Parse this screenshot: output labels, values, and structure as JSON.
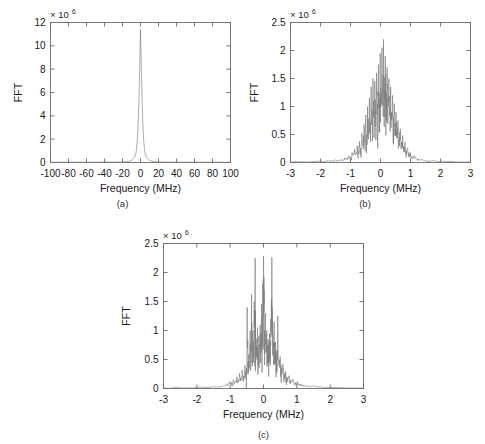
{
  "figure": {
    "background": "#ffffff",
    "trace_color": "#7d7d7d",
    "axis_color": "#6a6a6a"
  },
  "panels": [
    {
      "id": "a",
      "caption": "(a)",
      "xlabel": "Frequency (MHz)",
      "ylabel": "FFT",
      "exponent_mantissa": "× 10",
      "exponent_power": "6",
      "xticks": [
        "-100",
        "-80",
        "-60",
        "-40",
        "-20",
        "0",
        "20",
        "40",
        "60",
        "80",
        "100"
      ],
      "xtick_values": [
        -100,
        -80,
        -60,
        -40,
        -20,
        0,
        20,
        40,
        60,
        80,
        100
      ],
      "yticks": [
        "0",
        "2",
        "4",
        "6",
        "8",
        "10",
        "12"
      ],
      "ytick_values": [
        0,
        2,
        4,
        6,
        8,
        10,
        12
      ]
    },
    {
      "id": "b",
      "caption": "(b)",
      "xlabel": "Frequency (MHz)",
      "ylabel": "FFT",
      "exponent_mantissa": "× 10",
      "exponent_power": "6",
      "xticks": [
        "-3",
        "-2",
        "-1",
        "0",
        "1",
        "2",
        "3"
      ],
      "xtick_values": [
        -3,
        -2,
        -1,
        0,
        1,
        2,
        3
      ],
      "yticks": [
        "0",
        "0.5",
        "1",
        "1.5",
        "2",
        "2.5"
      ],
      "ytick_values": [
        0,
        0.5,
        1,
        1.5,
        2,
        2.5
      ]
    },
    {
      "id": "c",
      "caption": "(c)",
      "xlabel": "Frequency (MHz)",
      "ylabel": "FFT",
      "exponent_mantissa": "× 10",
      "exponent_power": "6",
      "xticks": [
        "-3",
        "-2",
        "-1",
        "0",
        "1",
        "2",
        "3"
      ],
      "xtick_values": [
        -3,
        -2,
        -1,
        0,
        1,
        2,
        3
      ],
      "yticks": [
        "0",
        "0.5",
        "1",
        "1.5",
        "2",
        "2.5"
      ],
      "ytick_values": [
        0,
        0.5,
        1,
        1.5,
        2,
        2.5
      ]
    }
  ],
  "chart_data": [
    {
      "type": "line",
      "panel": "a",
      "title": "",
      "xlabel": "Frequency (MHz)",
      "ylabel": "FFT",
      "y_exponent": 1000000,
      "y_exponent_label": "x 10^6",
      "xlim": [
        -100,
        100
      ],
      "ylim": [
        0,
        12
      ],
      "grid": false,
      "legend": "none",
      "description": "Single narrow spectral peak centred at 0 MHz reaching about 11.4e6, essentially zero elsewhere across the +/-100 MHz span.",
      "peak_x": 0,
      "peak_y": 11.4,
      "x": [
        -100,
        -90,
        -80,
        -70,
        -60,
        -50,
        -40,
        -30,
        -20,
        -14,
        -10,
        -8,
        -7,
        -6,
        -5.2,
        -4.5,
        -4,
        -3.5,
        -3,
        -2.6,
        -2.2,
        -1.8,
        -1.4,
        -1.0,
        -0.7,
        -0.45,
        -0.25,
        -0.1,
        0,
        0.1,
        0.25,
        0.45,
        0.7,
        1.0,
        1.4,
        1.8,
        2.2,
        2.6,
        3,
        3.5,
        4,
        4.5,
        5.2,
        6,
        7,
        8,
        10,
        14,
        20,
        30,
        40,
        50,
        60,
        70,
        80,
        90,
        100
      ],
      "y": [
        0.02,
        0.02,
        0.03,
        0.02,
        0.03,
        0.02,
        0.04,
        0.03,
        0.05,
        0.08,
        0.18,
        0.3,
        0.42,
        0.55,
        0.75,
        1.1,
        1.5,
        2.0,
        2.7,
        3.4,
        4.3,
        5.3,
        6.5,
        7.8,
        9.0,
        9.9,
        10.6,
        11.1,
        11.4,
        11.1,
        10.6,
        9.9,
        9.0,
        7.8,
        6.5,
        5.3,
        4.3,
        3.4,
        2.7,
        2.0,
        1.5,
        1.1,
        0.75,
        0.55,
        0.42,
        0.3,
        0.18,
        0.08,
        0.05,
        0.03,
        0.04,
        0.02,
        0.03,
        0.02,
        0.03,
        0.02,
        0.02
      ]
    },
    {
      "type": "line",
      "panel": "b",
      "title": "",
      "xlabel": "Frequency (MHz)",
      "ylabel": "FFT",
      "y_exponent": 1000000,
      "y_exponent_label": "x 10^6",
      "xlim": [
        -3,
        3
      ],
      "ylim": [
        0,
        2.5
      ],
      "grid": false,
      "legend": "none",
      "description": "Noisy spiky spectrum concentrated between about -1 and +1.2 MHz, peaking near 0.1 MHz at roughly 2.2e6, with dense jagged sidelobes decaying towards zero beyond +/-1 MHz.",
      "peak_x": 0.1,
      "peak_y": 2.2,
      "x": [
        -3.0,
        -2.7,
        -2.4,
        -2.1,
        -1.9,
        -1.75,
        -1.6,
        -1.5,
        -1.4,
        -1.3,
        -1.2,
        -1.12,
        -1.05,
        -1.0,
        -0.95,
        -0.9,
        -0.86,
        -0.82,
        -0.78,
        -0.74,
        -0.7,
        -0.66,
        -0.62,
        -0.58,
        -0.55,
        -0.52,
        -0.49,
        -0.46,
        -0.43,
        -0.4,
        -0.37,
        -0.34,
        -0.31,
        -0.28,
        -0.25,
        -0.22,
        -0.19,
        -0.16,
        -0.13,
        -0.1,
        -0.07,
        -0.04,
        -0.01,
        0.02,
        0.05,
        0.08,
        0.1,
        0.13,
        0.16,
        0.19,
        0.22,
        0.25,
        0.28,
        0.31,
        0.34,
        0.37,
        0.4,
        0.43,
        0.46,
        0.49,
        0.52,
        0.55,
        0.58,
        0.62,
        0.66,
        0.7,
        0.74,
        0.78,
        0.82,
        0.86,
        0.9,
        0.95,
        1.0,
        1.05,
        1.12,
        1.2,
        1.3,
        1.4,
        1.5,
        1.6,
        1.75,
        1.9,
        2.1,
        2.4,
        2.7,
        3.0
      ],
      "y": [
        0.01,
        0.02,
        0.01,
        0.03,
        0.02,
        0.04,
        0.03,
        0.05,
        0.04,
        0.06,
        0.08,
        0.07,
        0.12,
        0.1,
        0.18,
        0.14,
        0.24,
        0.16,
        0.3,
        0.2,
        0.38,
        0.26,
        0.52,
        0.3,
        0.68,
        0.4,
        0.85,
        0.5,
        1.0,
        0.62,
        1.15,
        0.7,
        1.35,
        0.8,
        1.5,
        0.9,
        1.45,
        0.95,
        1.6,
        1.05,
        1.75,
        1.15,
        1.95,
        1.25,
        2.05,
        1.4,
        2.2,
        1.3,
        1.9,
        1.2,
        1.7,
        1.1,
        1.5,
        1.0,
        1.35,
        0.9,
        1.2,
        0.8,
        1.05,
        0.7,
        0.9,
        0.58,
        0.75,
        0.46,
        0.6,
        0.36,
        0.48,
        0.28,
        0.36,
        0.2,
        0.26,
        0.15,
        0.18,
        0.1,
        0.12,
        0.07,
        0.06,
        0.05,
        0.04,
        0.03,
        0.04,
        0.02,
        0.03,
        0.02,
        0.01,
        0.01
      ]
    },
    {
      "type": "line",
      "panel": "c",
      "title": "",
      "xlabel": "Frequency (MHz)",
      "ylabel": "FFT",
      "y_exponent": 1000000,
      "y_exponent_label": "x 10^6",
      "xlim": [
        -3,
        3
      ],
      "ylim": [
        0,
        2.5
      ],
      "grid": false,
      "legend": "none",
      "description": "Noisy spectrum spanning about -1 to +1 MHz with three dominant narrow spikes near -0.25, 0.0 and +0.25 MHz each reaching roughly 2.25e6, plus jagged lower sidelobes.",
      "peak_x": 0.0,
      "peak_y": 2.28,
      "x": [
        -3.0,
        -2.6,
        -2.2,
        -1.9,
        -1.7,
        -1.5,
        -1.35,
        -1.2,
        -1.1,
        -1.02,
        -0.95,
        -0.9,
        -0.85,
        -0.8,
        -0.76,
        -0.72,
        -0.68,
        -0.64,
        -0.6,
        -0.56,
        -0.52,
        -0.49,
        -0.46,
        -0.44,
        -0.42,
        -0.4,
        -0.38,
        -0.36,
        -0.34,
        -0.32,
        -0.3,
        -0.28,
        -0.26,
        -0.25,
        -0.24,
        -0.22,
        -0.2,
        -0.18,
        -0.16,
        -0.14,
        -0.12,
        -0.1,
        -0.08,
        -0.06,
        -0.04,
        -0.02,
        0.0,
        0.02,
        0.04,
        0.06,
        0.08,
        0.1,
        0.12,
        0.14,
        0.16,
        0.18,
        0.2,
        0.22,
        0.24,
        0.25,
        0.26,
        0.28,
        0.3,
        0.32,
        0.34,
        0.36,
        0.38,
        0.4,
        0.43,
        0.46,
        0.5,
        0.54,
        0.58,
        0.62,
        0.66,
        0.7,
        0.76,
        0.82,
        0.88,
        0.95,
        1.02,
        1.1,
        1.2,
        1.35,
        1.5,
        1.7,
        1.9,
        2.2,
        2.6,
        3.0
      ],
      "y": [
        0.01,
        0.02,
        0.01,
        0.03,
        0.02,
        0.04,
        0.03,
        0.05,
        0.08,
        0.12,
        0.1,
        0.16,
        0.12,
        0.2,
        0.15,
        0.26,
        0.18,
        0.32,
        0.22,
        0.4,
        0.3,
        1.4,
        0.45,
        0.6,
        0.5,
        1.0,
        0.6,
        1.62,
        0.7,
        1.0,
        0.8,
        1.5,
        1.2,
        2.25,
        1.3,
        0.85,
        0.7,
        1.05,
        0.6,
        0.9,
        0.72,
        1.1,
        0.8,
        1.45,
        1.0,
        1.8,
        2.28,
        1.7,
        1.0,
        1.3,
        0.75,
        1.0,
        0.65,
        0.85,
        0.6,
        0.95,
        0.7,
        1.2,
        1.5,
        2.26,
        1.4,
        0.95,
        0.75,
        1.15,
        0.6,
        0.8,
        0.5,
        0.65,
        1.25,
        0.45,
        0.55,
        0.35,
        0.42,
        0.25,
        0.3,
        0.2,
        0.22,
        0.14,
        0.16,
        0.1,
        0.12,
        0.08,
        0.06,
        0.04,
        0.05,
        0.03,
        0.02,
        0.02,
        0.01,
        0.01
      ]
    }
  ]
}
